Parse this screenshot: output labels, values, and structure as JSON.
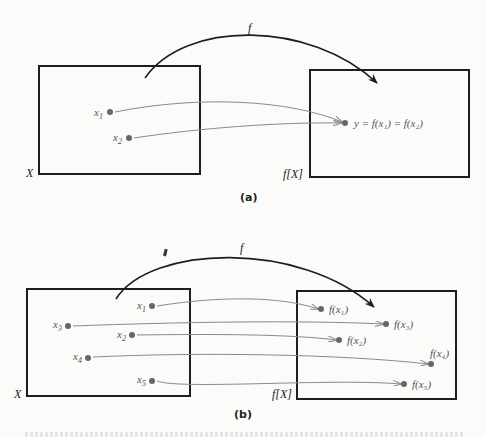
{
  "figure": {
    "part_a": {
      "label": "(a)",
      "function_label": "f",
      "domain_label": "X",
      "image_label": "f[X]",
      "domain_points": [
        {
          "name": "x",
          "sub": "1"
        },
        {
          "name": "x",
          "sub": "2"
        }
      ],
      "image_point_label": "y = f(x₁) = f(x₂)"
    },
    "part_b": {
      "label": "(b)",
      "function_label": "f",
      "domain_label": "X",
      "image_label": "f[X]",
      "domain_points": [
        {
          "name": "x",
          "sub": "1"
        },
        {
          "name": "x",
          "sub": "3"
        },
        {
          "name": "x",
          "sub": "2"
        },
        {
          "name": "x",
          "sub": "4"
        },
        {
          "name": "x",
          "sub": "5"
        }
      ],
      "image_points": [
        {
          "text": "f(x₁)"
        },
        {
          "text": "f(x₃)"
        },
        {
          "text": "f(x₂)"
        },
        {
          "text": "f(x₄)"
        },
        {
          "text": "f(x₅)"
        }
      ]
    },
    "colors": {
      "box": "#1e1e1e",
      "arrow_main": "#1e1e1e",
      "mapping_arrow": "#8a8a8a",
      "dot": "#666666",
      "label": "#555555"
    }
  }
}
